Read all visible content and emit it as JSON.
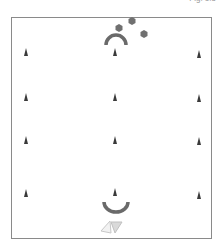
{
  "figure": {
    "label": "Fig. 1.5",
    "type": "drill-diagram"
  },
  "colors": {
    "border": "#8a8a8a",
    "cone": "#3a3a3a",
    "ball": "#707070",
    "arc": "#6a6a6a",
    "triangle": "#c8c8c8"
  },
  "field": {
    "x": 11,
    "y": 17,
    "width": 201,
    "height": 222
  },
  "cones": [
    {
      "x": 26,
      "y": 53
    },
    {
      "x": 115,
      "y": 53
    },
    {
      "x": 199,
      "y": 55
    },
    {
      "x": 26,
      "y": 98
    },
    {
      "x": 115,
      "y": 98
    },
    {
      "x": 199,
      "y": 99
    },
    {
      "x": 26,
      "y": 141
    },
    {
      "x": 115,
      "y": 141
    },
    {
      "x": 199,
      "y": 142
    },
    {
      "x": 26,
      "y": 194
    },
    {
      "x": 115,
      "y": 193
    },
    {
      "x": 199,
      "y": 196
    }
  ],
  "balls": [
    {
      "x": 119,
      "y": 28
    },
    {
      "x": 132,
      "y": 21
    },
    {
      "x": 144,
      "y": 34
    }
  ],
  "player_top": {
    "x": 116,
    "y": 45,
    "orientation": "up"
  },
  "player_bottom": {
    "x": 116,
    "y": 202,
    "orientation": "down"
  },
  "triangles": [
    {
      "x": 106,
      "y": 228,
      "style": "outline",
      "direction": "left"
    },
    {
      "x": 116,
      "y": 228,
      "style": "filled",
      "direction": "down"
    }
  ]
}
